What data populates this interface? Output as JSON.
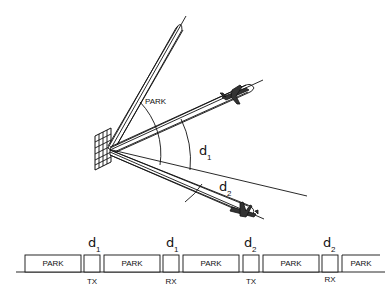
{
  "diagram": {
    "beam_labels": {
      "park": "PARK",
      "angle_1_main": "d",
      "angle_1_sub": "1",
      "angle_2_main": "d",
      "angle_2_sub": "2"
    },
    "timeline": {
      "slots": [
        {
          "type": "PARK",
          "label": "PARK",
          "below": ""
        },
        {
          "type": "TX",
          "label": "",
          "below": "TX",
          "above_main": "d",
          "above_sub": "1"
        },
        {
          "type": "PARK",
          "label": "PARK",
          "below": ""
        },
        {
          "type": "RX",
          "label": "",
          "below": "RX",
          "above_main": "d",
          "above_sub": "1"
        },
        {
          "type": "PARK",
          "label": "PARK",
          "below": ""
        },
        {
          "type": "TX",
          "label": "",
          "below": "TX",
          "above_main": "d",
          "above_sub": "2"
        },
        {
          "type": "PARK",
          "label": "PARK",
          "below": ""
        },
        {
          "type": "RX",
          "label": "",
          "below": "RX",
          "above_main": "d",
          "above_sub": "2"
        },
        {
          "type": "PARK",
          "label": "PARK",
          "below": ""
        }
      ]
    },
    "colors": {
      "ink": "#111111",
      "background": "#ffffff"
    }
  }
}
